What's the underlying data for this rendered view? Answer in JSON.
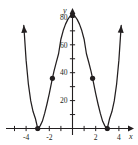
{
  "figure": {
    "kind": "cartesian-graph",
    "background_color": "#ffffff",
    "ink_color": "#231f20"
  },
  "axes": {
    "x_axis_name": "x",
    "y_axis_name": "y",
    "x_tick_labels": [
      "-4",
      "-2",
      "2",
      "4"
    ],
    "x_tick_values": [
      -4,
      -2,
      2,
      4
    ],
    "y_tick_labels": [
      "20",
      "40",
      "60",
      "80"
    ],
    "y_tick_values": [
      20,
      40,
      60,
      80
    ],
    "x_minor_ticks": [
      -5,
      -4,
      -3,
      -2,
      -1,
      1,
      2,
      3,
      4,
      5
    ],
    "y_minor_ticks": [
      10,
      20,
      30,
      40,
      50,
      60,
      70,
      80,
      90
    ]
  },
  "chart_data": {
    "type": "line",
    "title": "",
    "xlabel": "x",
    "ylabel": "y",
    "xlim": [
      -5.0,
      5.0
    ],
    "ylim": [
      -12,
      100
    ],
    "grid": false,
    "legend_position": "none",
    "axis_arrows": [
      "x-right",
      "y-up"
    ],
    "curve_end_arrows": [
      "left-up",
      "right-up"
    ],
    "equation_label": "",
    "series": [
      {
        "name": "y = (x^2 - 9)^2",
        "x": [
          -4.4,
          -4.2,
          -4.0,
          -3.8,
          -3.6,
          -3.4,
          -3.2,
          -3.0,
          -2.8,
          -2.6,
          -2.4,
          -2.2,
          -2.0,
          -1.8,
          -1.732,
          -1.6,
          -1.4,
          -1.2,
          -1.0,
          -0.8,
          -0.6,
          -0.4,
          -0.2,
          0.0,
          0.2,
          0.4,
          0.6,
          0.8,
          1.0,
          1.2,
          1.4,
          1.6,
          1.732,
          1.8,
          2.0,
          2.2,
          2.4,
          2.6,
          2.8,
          3.0,
          3.2,
          3.4,
          3.6,
          3.8,
          4.0,
          4.2,
          4.4
        ],
        "y": [
          108.2,
          73.96,
          49.0,
          31.58,
          19.8,
          12.18,
          7.18,
          0.0,
          1.7,
          5.15,
          10.82,
          17.56,
          25.0,
          33.18,
          36.0,
          40.96,
          47.47,
          53.58,
          64.0,
          70.22,
          74.82,
          78.24,
          80.64,
          81.0,
          80.64,
          78.24,
          74.82,
          70.22,
          64.0,
          53.58,
          47.47,
          40.96,
          36.0,
          33.18,
          25.0,
          17.56,
          10.82,
          5.15,
          1.7,
          0.0,
          7.18,
          12.18,
          19.8,
          31.58,
          49.0,
          73.96,
          108.2
        ]
      }
    ],
    "marked_points": [
      {
        "x": -3.0,
        "y": 0.0,
        "label": ""
      },
      {
        "x": -1.732,
        "y": 36.0,
        "label": ""
      },
      {
        "x": 0.0,
        "y": 81.0,
        "label": ""
      },
      {
        "x": 1.732,
        "y": 36.0,
        "label": ""
      },
      {
        "x": 3.0,
        "y": 0.0,
        "label": ""
      }
    ]
  }
}
